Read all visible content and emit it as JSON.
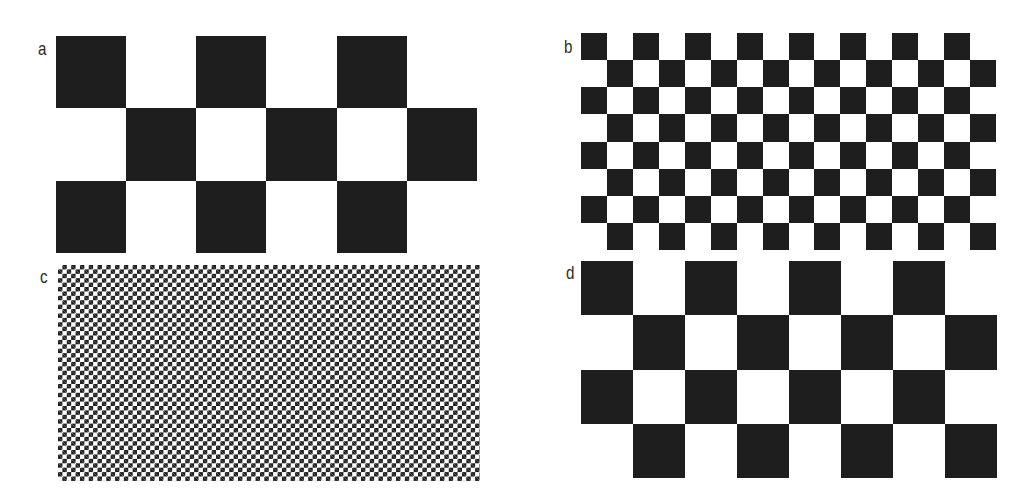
{
  "panels": [
    {
      "id": "a",
      "label": "a",
      "cols": 6,
      "rows": 3,
      "x": 56,
      "y": 36,
      "w": 421,
      "h": 217,
      "color_dark": "#1e1e1e",
      "color_light": "#ffffff"
    },
    {
      "id": "b",
      "label": "b",
      "cols": 16,
      "rows": 8,
      "x": 581,
      "y": 33,
      "w": 415,
      "h": 217,
      "color_dark": "#1e1e1e",
      "color_light": "#ffffff"
    },
    {
      "id": "c",
      "label": "c",
      "cols": 96,
      "rows": 49,
      "x": 58,
      "y": 265,
      "w": 422,
      "h": 216,
      "color_dark": "#1e1e1e",
      "color_light": "#ffffff",
      "note": "fine checkerboard with moire aliasing bands"
    },
    {
      "id": "d",
      "label": "d",
      "cols": 8,
      "rows": 4,
      "x": 581,
      "y": 261,
      "w": 416,
      "h": 217,
      "color_dark": "#1e1e1e",
      "color_light": "#ffffff"
    }
  ],
  "labels": {
    "a": {
      "text": "a",
      "x": 38,
      "y": 38
    },
    "b": {
      "text": "b",
      "x": 564,
      "y": 36
    },
    "c": {
      "text": "c",
      "x": 40,
      "y": 266
    },
    "d": {
      "text": "d",
      "x": 566,
      "y": 262
    }
  }
}
